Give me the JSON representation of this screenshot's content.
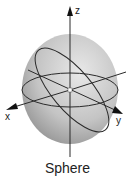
{
  "diagram": {
    "caption": "Sphere",
    "axes": {
      "x_label": "x",
      "y_label": "y",
      "z_label": "z"
    },
    "colors": {
      "sphere_light": "#e6e6e6",
      "sphere_dark": "#9a9a9a",
      "line": "#2a2a2a",
      "center_point": "#ffffff"
    }
  }
}
